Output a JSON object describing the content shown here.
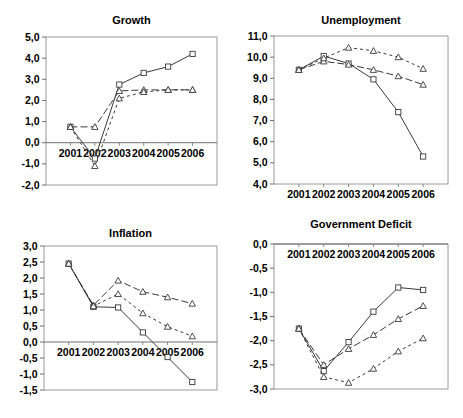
{
  "figure": {
    "panels": [
      "growth",
      "unemployment",
      "inflation",
      "deficit"
    ]
  },
  "chart_data": [
    {
      "id": "growth",
      "type": "line",
      "title": "Growth",
      "xlabel": "",
      "ylabel": "",
      "x": [
        "2001",
        "2002",
        "2003",
        "2004",
        "2005",
        "2006"
      ],
      "ylim": [
        -2.0,
        5.0
      ],
      "yticks": [
        "-2,0",
        "-1,0",
        "0,0",
        "1,0",
        "2,0",
        "3,0",
        "4,0",
        "5,0"
      ],
      "ytick_values": [
        -2.0,
        -1.0,
        0.0,
        1.0,
        2.0,
        3.0,
        4.0,
        5.0
      ],
      "grid": false,
      "legend": "none",
      "xaxis_labels_at_zero": true,
      "series": [
        {
          "name": "series-1",
          "style": "solid",
          "marker": "square",
          "values": [
            0.75,
            -0.75,
            2.75,
            3.3,
            3.6,
            4.2
          ]
        },
        {
          "name": "series-2",
          "style": "dashed",
          "marker": "triangle",
          "values": [
            0.75,
            0.75,
            2.45,
            2.5,
            2.5,
            2.5
          ]
        },
        {
          "name": "series-3",
          "style": "dotted",
          "marker": "triangle",
          "values": [
            0.75,
            -1.1,
            2.1,
            2.4,
            2.5,
            2.5
          ]
        }
      ]
    },
    {
      "id": "unemployment",
      "type": "line",
      "title": "Unemployment",
      "xlabel": "",
      "ylabel": "",
      "x": [
        "2001",
        "2002",
        "2003",
        "2004",
        "2005",
        "2006"
      ],
      "ylim": [
        4.0,
        11.0
      ],
      "yticks": [
        "4,0",
        "5,0",
        "6,0",
        "7,0",
        "8,0",
        "9,0",
        "10,0",
        "11,0"
      ],
      "ytick_values": [
        4.0,
        5.0,
        6.0,
        7.0,
        8.0,
        9.0,
        10.0,
        11.0
      ],
      "grid": false,
      "legend": "none",
      "xaxis_labels_at_zero": false,
      "series": [
        {
          "name": "series-1",
          "style": "solid",
          "marker": "square",
          "values": [
            9.4,
            10.05,
            9.7,
            8.95,
            7.4,
            5.3
          ]
        },
        {
          "name": "series-2",
          "style": "dashed",
          "marker": "triangle",
          "values": [
            9.4,
            9.8,
            9.65,
            9.4,
            9.1,
            8.7
          ]
        },
        {
          "name": "series-3",
          "style": "dotted",
          "marker": "triangle",
          "values": [
            9.4,
            9.95,
            10.45,
            10.3,
            10.0,
            9.45
          ]
        }
      ]
    },
    {
      "id": "inflation",
      "type": "line",
      "title": "Inflation",
      "xlabel": "",
      "ylabel": "",
      "x": [
        "2001",
        "2002",
        "2003",
        "2004",
        "2005",
        "2006"
      ],
      "ylim": [
        -1.5,
        3.0
      ],
      "yticks": [
        "-1,5",
        "-1,0",
        "-0,5",
        "0,0",
        "0,5",
        "1,0",
        "1,5",
        "2,0",
        "2,5",
        "3,0"
      ],
      "ytick_values": [
        -1.5,
        -1.0,
        -0.5,
        0.0,
        0.5,
        1.0,
        1.5,
        2.0,
        2.5,
        3.0
      ],
      "grid": false,
      "legend": "none",
      "xaxis_labels_at_zero": true,
      "series": [
        {
          "name": "series-1",
          "style": "solid",
          "marker": "square",
          "values": [
            2.45,
            1.1,
            1.08,
            0.3,
            -0.47,
            -1.25
          ]
        },
        {
          "name": "series-2",
          "style": "dashed",
          "marker": "triangle",
          "values": [
            2.45,
            1.15,
            1.92,
            1.57,
            1.4,
            1.2
          ]
        },
        {
          "name": "series-3",
          "style": "dotted",
          "marker": "triangle",
          "values": [
            2.45,
            1.12,
            1.5,
            0.9,
            0.48,
            0.18
          ]
        }
      ]
    },
    {
      "id": "deficit",
      "type": "line",
      "title": "Government Deficit",
      "xlabel": "",
      "ylabel": "",
      "x": [
        "2001",
        "2002",
        "2003",
        "2004",
        "2005",
        "2006"
      ],
      "ylim": [
        -3.0,
        0.0
      ],
      "yticks": [
        "-3,0",
        "-2,5",
        "-2,0",
        "-1,5",
        "-1,0",
        "-0,5",
        "0,0"
      ],
      "ytick_values": [
        -3.0,
        -2.5,
        -2.0,
        -1.5,
        -1.0,
        -0.5,
        0.0
      ],
      "grid": false,
      "legend": "none",
      "xaxis_labels_at_zero": true,
      "series": [
        {
          "name": "series-1",
          "style": "solid",
          "marker": "square",
          "values": [
            -1.75,
            -2.63,
            -2.03,
            -1.4,
            -0.9,
            -0.95
          ]
        },
        {
          "name": "series-2",
          "style": "dashed",
          "marker": "triangle",
          "values": [
            -1.75,
            -2.5,
            -2.17,
            -1.88,
            -1.55,
            -1.28
          ]
        },
        {
          "name": "series-3",
          "style": "dotted",
          "marker": "triangle",
          "values": [
            -1.75,
            -2.75,
            -2.87,
            -2.58,
            -2.22,
            -1.95
          ]
        }
      ]
    }
  ]
}
